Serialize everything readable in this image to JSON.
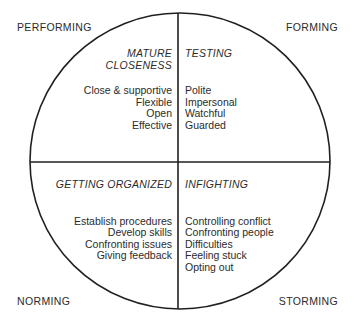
{
  "diagram": {
    "colors": {
      "line": "#231f20",
      "text": "#2b2b2b",
      "background": "#ffffff"
    },
    "geometry": {
      "circle_center_x": 180,
      "circle_center_y": 161,
      "circle_radius_x": 150,
      "circle_radius_y": 148,
      "vertical_divider_x": 178,
      "horizontal_divider_y": 162
    },
    "stage_labels": {
      "top_left": "PERFORMING",
      "top_right": "FORMING",
      "bottom_left": "NORMING",
      "bottom_right": "STORMING"
    },
    "quadrants": [
      {
        "id": "top-left",
        "title_lines": [
          "MATURE",
          "CLOSENESS"
        ],
        "items": [
          "Close & supportive",
          "Flexible",
          "Open",
          "Effective"
        ],
        "align": "right",
        "stage": "PERFORMING"
      },
      {
        "id": "top-right",
        "title_lines": [
          "TESTING"
        ],
        "items": [
          "Polite",
          "Impersonal",
          "Watchful",
          "Guarded"
        ],
        "align": "left",
        "stage": "FORMING"
      },
      {
        "id": "bottom-left",
        "title_lines": [
          "GETTING ORGANIZED"
        ],
        "items": [
          "Establish procedures",
          "Develop skills",
          "Confronting issues",
          "Giving feedback"
        ],
        "align": "right",
        "stage": "NORMING"
      },
      {
        "id": "bottom-right",
        "title_lines": [
          "INFIGHTING"
        ],
        "items": [
          "Controlling conflict",
          "Confronting people",
          "Difficulties",
          "Feeling stuck",
          "Opting out"
        ],
        "align": "left",
        "stage": "STORMING"
      }
    ]
  }
}
